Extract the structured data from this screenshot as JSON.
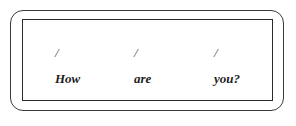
{
  "figure": {
    "kind": "prosody-annotation-box",
    "outer_border_color": "#3a3a3a",
    "inner_border_color": "#2b2b2b",
    "background_color": "#ffffff",
    "text_color": "#1d1d1d",
    "tone_mark_color": "#4a4a4a"
  },
  "utterance": {
    "sentence": "How are you?",
    "tokens": [
      {
        "word": "How",
        "tone_mark": "/"
      },
      {
        "word": "are",
        "tone_mark": "/"
      },
      {
        "word": "you?",
        "tone_mark": "/"
      }
    ]
  }
}
